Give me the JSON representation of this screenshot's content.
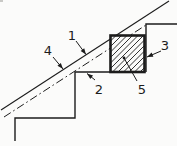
{
  "figure": {
    "background": "#fbfbfa",
    "ink": "#1c1c1c",
    "width": 177,
    "height": 146,
    "lines": {
      "pitch_line": {
        "name": "pitch-line-solid",
        "points": [
          [
            1,
            110
          ],
          [
            169,
            1
          ]
        ],
        "style": "solid",
        "width": 1.1
      },
      "nosing_line": {
        "name": "nosing-line-dashdot",
        "points": [
          [
            4,
            117
          ],
          [
            146,
            25
          ]
        ],
        "style": "dashdot",
        "width": 1.0
      },
      "lower_steps": {
        "name": "stair-step-outline",
        "points": [
          [
            15,
            141
          ],
          [
            15,
            118
          ],
          [
            75,
            118
          ],
          [
            75,
            72
          ],
          [
            111,
            72
          ]
        ],
        "style": "solid",
        "width": 1.4
      },
      "upper_step": {
        "name": "upper-step-outline",
        "points": [
          [
            146,
            72
          ],
          [
            146,
            24
          ],
          [
            177,
            24
          ]
        ],
        "style": "solid",
        "width": 1.4
      }
    },
    "block": {
      "name": "hatched-block-section",
      "x": 110.5,
      "y": 35.5,
      "w": 34,
      "h": 36.5,
      "border_width": 2.6,
      "hatch_spacing": 5.5,
      "hatch_width": 0.9,
      "hatch_direction": "bottomleft-to-topright"
    },
    "labels": [
      {
        "name": "part-label-1",
        "text": "1",
        "x": 72,
        "y": 40,
        "leader": [
          [
            76,
            41
          ],
          [
            86,
            54.5
          ]
        ],
        "tip": "arrow"
      },
      {
        "name": "part-label-2",
        "text": "2",
        "x": 99,
        "y": 94,
        "leader": [
          [
            95,
            80
          ],
          [
            87,
            73.5
          ]
        ],
        "tip": "arrow"
      },
      {
        "name": "part-label-3",
        "text": "3",
        "x": 165,
        "y": 50,
        "leader": [
          [
            161,
            51
          ],
          [
            147,
            57
          ]
        ],
        "tip": "arrow"
      },
      {
        "name": "part-label-4",
        "text": "4",
        "x": 48,
        "y": 55,
        "leader": [
          [
            53,
            57
          ],
          [
            63,
            69
          ]
        ],
        "tip": "arrow"
      },
      {
        "name": "part-label-5",
        "text": "5",
        "x": 142,
        "y": 94,
        "leader": [
          [
            137,
            81
          ],
          [
            124,
            58
          ]
        ],
        "tip": "dot"
      }
    ],
    "artifact": {
      "name": "scan-speck",
      "x": 0,
      "y": 0,
      "w": 3,
      "h": 2,
      "color": "#c9c9c6"
    }
  }
}
